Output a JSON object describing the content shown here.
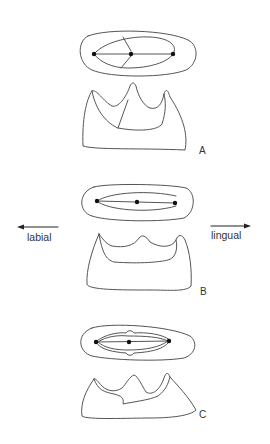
{
  "figure": {
    "panels": [
      {
        "label": "A",
        "description": "Occlusal outline with three cusp points connected by a line and two crest branches; lateral profile with three pointed cusps"
      },
      {
        "label": "B",
        "description": "Elongated occlusal outline with three cusp points in a line; lateral profile with three low cusps"
      },
      {
        "label": "C",
        "description": "Occlusal outline with doubled inner contour and three cusp points; lateral profile with three cusps, sloping base"
      }
    ],
    "direction_arrows": {
      "left": "labial",
      "right": "lingual"
    }
  }
}
